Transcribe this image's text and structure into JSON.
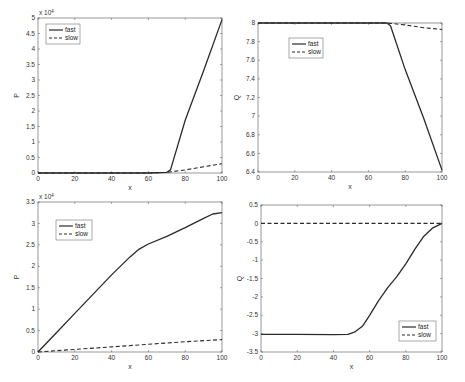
{
  "chart_data": [
    {
      "id": "top-left",
      "type": "line",
      "title": "",
      "xlabel": "x",
      "ylabel": "P",
      "y_multiplier": "x 10^4",
      "xlim": [
        0,
        100
      ],
      "ylim": [
        0,
        5
      ],
      "xticks": [
        0,
        20,
        40,
        60,
        80,
        100
      ],
      "yticks": [
        0,
        0.5,
        1,
        1.5,
        2,
        2.5,
        3,
        3.5,
        4,
        4.5,
        5
      ],
      "legend": {
        "position": "upper-left",
        "entries": [
          "fast",
          "slow"
        ]
      },
      "series": [
        {
          "name": "fast",
          "style": "solid",
          "x": [
            0,
            20,
            40,
            60,
            70,
            72,
            80,
            90,
            100
          ],
          "y": [
            0,
            0,
            0,
            0,
            0.02,
            0.1,
            1.7,
            3.3,
            4.95
          ]
        },
        {
          "name": "slow",
          "style": "dashed",
          "x": [
            0,
            20,
            40,
            60,
            70,
            80,
            90,
            100
          ],
          "y": [
            0,
            0,
            0,
            0,
            0.02,
            0.1,
            0.2,
            0.3
          ]
        }
      ]
    },
    {
      "id": "top-right",
      "type": "line",
      "title": "",
      "xlabel": "x",
      "ylabel": "Q",
      "xlim": [
        0,
        100
      ],
      "ylim": [
        6.4,
        8
      ],
      "xticks": [
        0,
        20,
        40,
        60,
        80,
        100
      ],
      "yticks": [
        6.4,
        6.6,
        6.8,
        7,
        7.2,
        7.4,
        7.6,
        7.8,
        8
      ],
      "legend": {
        "position": "upper-left",
        "entries": [
          "fast",
          "slow"
        ]
      },
      "series": [
        {
          "name": "fast",
          "style": "solid",
          "x": [
            0,
            20,
            40,
            60,
            70,
            72,
            80,
            90,
            100
          ],
          "y": [
            8,
            8,
            8,
            8,
            8,
            7.97,
            7.5,
            6.98,
            6.42
          ]
        },
        {
          "name": "slow",
          "style": "dashed",
          "x": [
            0,
            20,
            40,
            60,
            70,
            80,
            90,
            100
          ],
          "y": [
            8,
            8,
            8,
            8,
            8,
            7.98,
            7.95,
            7.93
          ]
        }
      ]
    },
    {
      "id": "bottom-left",
      "type": "line",
      "title": "",
      "xlabel": "x",
      "ylabel": "P",
      "y_multiplier": "x 10^4",
      "xlim": [
        0,
        100
      ],
      "ylim": [
        0,
        3.5
      ],
      "xticks": [
        0,
        20,
        40,
        60,
        80,
        100
      ],
      "yticks": [
        0,
        0.5,
        1,
        1.5,
        2,
        2.5,
        3,
        3.5
      ],
      "legend": {
        "position": "upper-left",
        "entries": [
          "fast",
          "slow"
        ]
      },
      "series": [
        {
          "name": "fast",
          "style": "solid",
          "x": [
            0,
            10,
            20,
            30,
            40,
            50,
            55,
            60,
            70,
            80,
            90,
            95,
            100
          ],
          "y": [
            0,
            0.45,
            0.9,
            1.35,
            1.8,
            2.22,
            2.4,
            2.52,
            2.7,
            2.9,
            3.12,
            3.22,
            3.25
          ]
        },
        {
          "name": "slow",
          "style": "dashed",
          "x": [
            0,
            20,
            40,
            60,
            80,
            100
          ],
          "y": [
            0,
            0.06,
            0.12,
            0.18,
            0.24,
            0.29
          ]
        }
      ]
    },
    {
      "id": "bottom-right",
      "type": "line",
      "title": "",
      "xlabel": "x",
      "ylabel": "Q",
      "xlim": [
        0,
        100
      ],
      "ylim": [
        -3.5,
        0.5
      ],
      "xticks": [
        0,
        20,
        40,
        60,
        80,
        100
      ],
      "yticks": [
        -3.5,
        -3,
        -2.5,
        -2,
        -1.5,
        -1,
        -0.5,
        0,
        0.5
      ],
      "legend": {
        "position": "lower-right",
        "entries": [
          "fast",
          "slow"
        ]
      },
      "series": [
        {
          "name": "fast",
          "style": "solid",
          "x": [
            0,
            20,
            40,
            48,
            52,
            56,
            60,
            65,
            70,
            75,
            80,
            85,
            90,
            95,
            100
          ],
          "y": [
            -3.02,
            -3.02,
            -3.03,
            -3.02,
            -2.95,
            -2.8,
            -2.5,
            -2.1,
            -1.75,
            -1.45,
            -1.1,
            -0.7,
            -0.35,
            -0.12,
            0
          ]
        },
        {
          "name": "slow",
          "style": "dashed",
          "x": [
            0,
            20,
            40,
            60,
            80,
            100
          ],
          "y": [
            0,
            0,
            0,
            0,
            0,
            0
          ]
        }
      ]
    }
  ],
  "labels": {
    "multiplier_base": "x 10",
    "multiplier_exp": "4",
    "xlabel": "x",
    "ylabel_p": "P",
    "ylabel_q": "Q",
    "legend_fast": "fast",
    "legend_slow": "slow"
  }
}
